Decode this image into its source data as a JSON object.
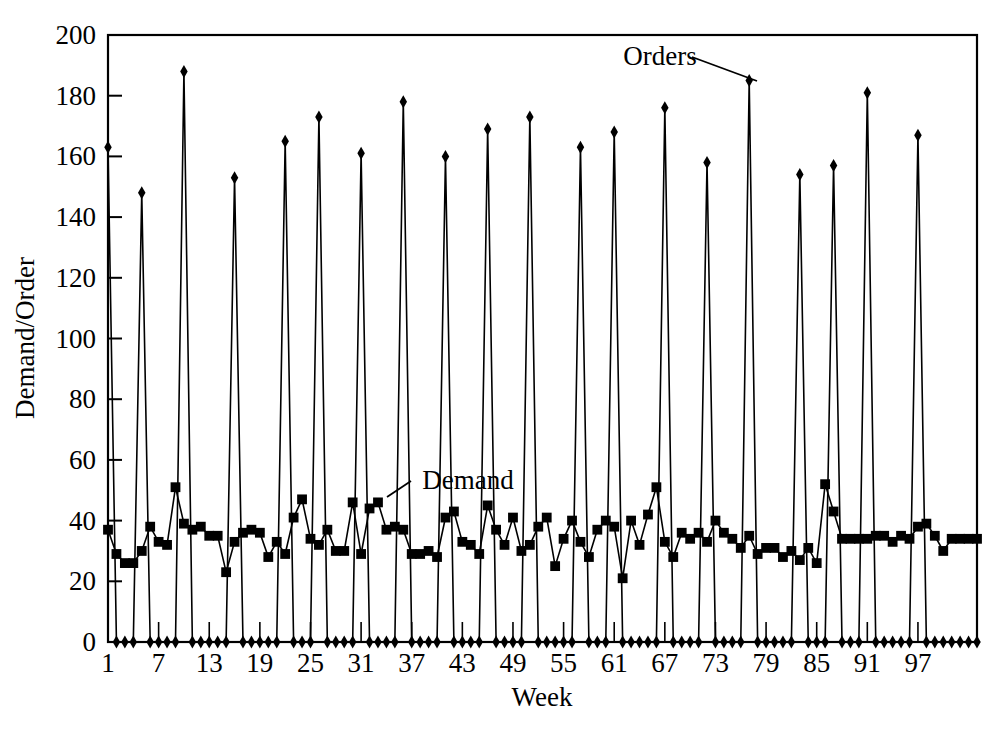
{
  "chart_data": {
    "type": "line",
    "title": "",
    "xlabel": "Week",
    "ylabel": "Demand/Order",
    "xlim": [
      1,
      104
    ],
    "ylim": [
      0,
      200
    ],
    "ytick_step": 20,
    "yticks": [
      0,
      20,
      40,
      60,
      80,
      100,
      120,
      140,
      160,
      180,
      200
    ],
    "ytick_labels": [
      "0",
      "20",
      "40",
      "60",
      "80",
      "100",
      "120",
      "140",
      "160",
      "180",
      "200"
    ],
    "xticks": [
      1,
      7,
      13,
      19,
      25,
      31,
      37,
      43,
      49,
      55,
      61,
      67,
      73,
      79,
      85,
      91,
      97
    ],
    "xtick_labels": [
      "1",
      "7",
      "13",
      "19",
      "25",
      "31",
      "37",
      "43",
      "49",
      "55",
      "61",
      "67",
      "73",
      "79",
      "85",
      "91",
      "97"
    ],
    "grid": false,
    "legend_position": "inline-annotations",
    "annotations": [
      {
        "text": "Orders",
        "points_to_week": 77,
        "points_to_value": 185
      },
      {
        "text": "Demand",
        "points_to_week": 33,
        "points_to_value": 46
      }
    ],
    "x": [
      1,
      2,
      3,
      4,
      5,
      6,
      7,
      8,
      9,
      10,
      11,
      12,
      13,
      14,
      15,
      16,
      17,
      18,
      19,
      20,
      21,
      22,
      23,
      24,
      25,
      26,
      27,
      28,
      29,
      30,
      31,
      32,
      33,
      34,
      35,
      36,
      37,
      38,
      39,
      40,
      41,
      42,
      43,
      44,
      45,
      46,
      47,
      48,
      49,
      50,
      51,
      52,
      53,
      54,
      55,
      56,
      57,
      58,
      59,
      60,
      61,
      62,
      63,
      64,
      65,
      66,
      67,
      68,
      69,
      70,
      71,
      72,
      73,
      74,
      75,
      76,
      77,
      78,
      79,
      80,
      81,
      82,
      83,
      84,
      85,
      86,
      87,
      88,
      89,
      90,
      91,
      92,
      93,
      94,
      95,
      96,
      97,
      98,
      99,
      100,
      101,
      102,
      103,
      104
    ],
    "series": [
      {
        "name": "Orders",
        "marker": "diamond",
        "values": [
          163,
          0,
          0,
          0,
          148,
          0,
          0,
          0,
          0,
          188,
          0,
          0,
          0,
          0,
          0,
          153,
          0,
          0,
          0,
          0,
          0,
          165,
          0,
          0,
          0,
          173,
          0,
          0,
          0,
          0,
          161,
          0,
          0,
          0,
          0,
          178,
          0,
          0,
          0,
          0,
          160,
          0,
          0,
          0,
          0,
          169,
          0,
          0,
          0,
          0,
          173,
          0,
          0,
          0,
          0,
          0,
          163,
          0,
          0,
          0,
          168,
          0,
          0,
          0,
          0,
          0,
          176,
          0,
          0,
          0,
          0,
          158,
          0,
          0,
          0,
          0,
          185,
          0,
          0,
          0,
          0,
          0,
          154,
          0,
          0,
          0,
          157,
          0,
          0,
          0,
          181,
          0,
          0,
          0,
          0,
          0,
          167,
          0,
          0,
          0,
          0,
          0,
          0,
          0
        ]
      },
      {
        "name": "Demand",
        "marker": "square",
        "values": [
          37,
          29,
          26,
          26,
          30,
          38,
          33,
          32,
          51,
          39,
          37,
          38,
          35,
          35,
          23,
          33,
          36,
          37,
          36,
          28,
          33,
          29,
          41,
          47,
          34,
          32,
          37,
          30,
          30,
          46,
          29,
          44,
          46,
          37,
          38,
          37,
          29,
          29,
          30,
          28,
          41,
          43,
          33,
          32,
          29,
          45,
          37,
          32,
          41,
          30,
          32,
          38,
          41,
          25,
          34,
          40,
          33,
          28,
          37,
          40,
          38,
          21,
          40,
          32,
          42,
          51,
          33,
          28,
          36,
          34,
          36,
          33,
          40,
          36,
          34,
          31,
          35,
          29,
          31,
          31,
          28,
          30,
          27,
          31,
          26,
          52,
          43,
          34,
          34,
          34,
          34,
          35,
          35,
          33,
          35,
          34,
          38,
          39,
          35,
          30,
          34,
          34,
          34,
          34
        ]
      }
    ]
  }
}
